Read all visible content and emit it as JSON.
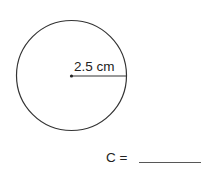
{
  "diagram": {
    "shape": "circle",
    "radius_label": "2.5 cm",
    "prompt_label": "C =",
    "answer_blank": ""
  },
  "colors": {
    "stroke": "#333333",
    "text": "#222222",
    "background": "#ffffff"
  }
}
